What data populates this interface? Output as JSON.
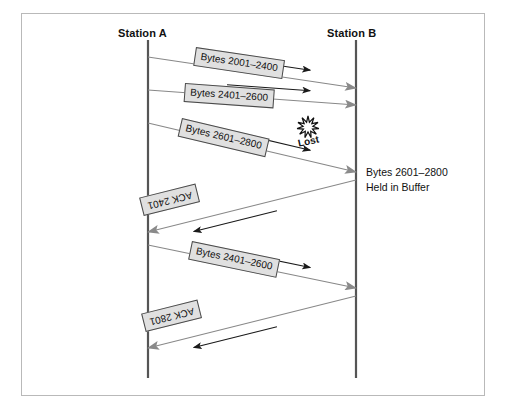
{
  "figure": {
    "background_color": "#ffffff",
    "frame_border_color": "#b9b9b9"
  },
  "stations": {
    "left": {
      "label": "Station A",
      "line_x": 148
    },
    "right": {
      "label": "Station B",
      "line_x": 356
    }
  },
  "colors": {
    "timeline": "#555555",
    "message_line": "#888888",
    "arrow_small": "#1a1a1a",
    "arrow_large": "#8a8a8a",
    "label_fill": "#e0e0e0",
    "label_border": "#4a4a4a",
    "text": "#111111"
  },
  "messages": [
    {
      "id": "msg-bytes-2001-2400",
      "label": "Bytes 2001–2400",
      "direction": "a-to-b",
      "from_x": 148,
      "from_y": 57,
      "to_x": 356,
      "to_y": 88,
      "label_x": 196,
      "label_y": 47,
      "lost": false
    },
    {
      "id": "msg-bytes-2401-2600",
      "label": "Bytes 2401–2600",
      "direction": "a-to-b",
      "from_x": 148,
      "from_y": 90,
      "to_x": 356,
      "to_y": 105,
      "label_x": 185,
      "label_y": 83,
      "lost": false
    },
    {
      "id": "msg-bytes-2601-2800-lost",
      "label": "Bytes 2601–2800",
      "direction": "a-to-b",
      "from_x": 148,
      "from_y": 123,
      "to_x": 356,
      "to_y": 172,
      "label_x": 182,
      "label_y": 118,
      "lost": true
    },
    {
      "id": "msg-ack-2401",
      "label": "ACK 2401",
      "direction": "b-to-a",
      "from_x": 356,
      "from_y": 180,
      "to_x": 148,
      "to_y": 232,
      "label_x": 200,
      "label_y": 202,
      "lost": false
    },
    {
      "id": "msg-bytes-2401-2600-retransmit",
      "label": "Bytes 2401–2600",
      "direction": "a-to-b",
      "from_x": 148,
      "from_y": 245,
      "to_x": 356,
      "to_y": 288,
      "label_x": 192,
      "label_y": 241,
      "lost": false
    },
    {
      "id": "msg-ack-2801",
      "label": "ACK 2801",
      "direction": "b-to-a",
      "from_x": 356,
      "from_y": 296,
      "to_x": 148,
      "to_y": 348,
      "label_x": 202,
      "label_y": 318,
      "lost": false
    }
  ],
  "annotations": {
    "lost": {
      "label": "Lost",
      "x": 297,
      "y": 138,
      "burst_cx": 308,
      "burst_cy": 127
    },
    "buffer_note": {
      "line1": "Bytes 2601–2800",
      "line2": "Held in Buffer"
    }
  },
  "timeline": {
    "top_y": 40,
    "bottom_y": 378
  }
}
